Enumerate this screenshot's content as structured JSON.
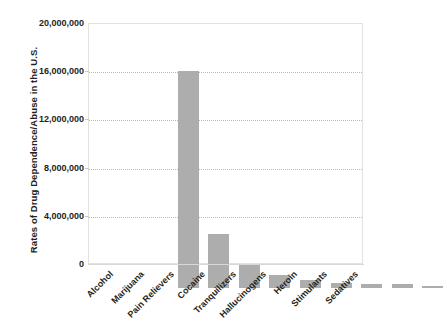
{
  "chart_data": {
    "type": "bar",
    "title": "",
    "xlabel": "",
    "ylabel": "Rates of Drug Dependence/Abuse in the U.S.",
    "categories": [
      "Alcohol",
      "Marijuana",
      "Pain Relievers",
      "Cocaine",
      "Tranquilizers",
      "Hallucinogens",
      "Heroin",
      "Stimulants",
      "Sedatives"
    ],
    "values": [
      18000000,
      4500000,
      2000000,
      1100000,
      700000,
      400000,
      350000,
      330000,
      150000
    ],
    "ylim": [
      0,
      20000000
    ],
    "y_ticks": [
      0,
      4000000,
      8000000,
      12000000,
      16000000,
      20000000
    ],
    "y_tick_labels": [
      "0",
      "4,000,000",
      "8,000,000",
      "12,000,000",
      "16,000,000",
      "20,000,000"
    ],
    "grid": "horizontal-dotted",
    "legend": "none",
    "bar_color": "#adadad",
    "gridline_color": "#b9b9b9",
    "frame_color": "#e2e2e2",
    "text_color": "#231f20",
    "background": "#ffffff"
  }
}
